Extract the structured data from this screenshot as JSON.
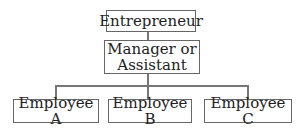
{
  "chart": {
    "root": {
      "label": "Entrepreneur"
    },
    "middle": {
      "label_line1": "Manager or",
      "label_line2": "Assistant"
    },
    "leaves": [
      {
        "label": "Employee A"
      },
      {
        "label": "Employee B"
      },
      {
        "label": "Employee C"
      }
    ]
  }
}
